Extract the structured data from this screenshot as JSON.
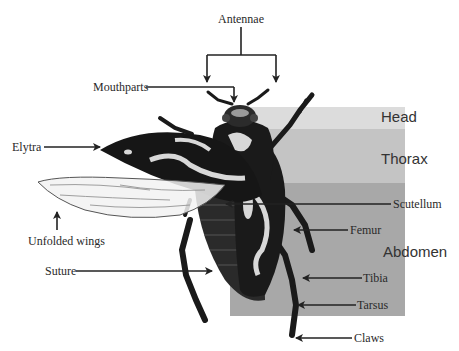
{
  "diagram": {
    "colors": {
      "head_band": "#dcdcdc",
      "thorax_band": "#c4c4c4",
      "abdomen_band": "#a8a8a8",
      "beetle_body": "#1a1a1a",
      "beetle_highlight": "#d8d8d8",
      "wing_fill": "#f2f2f2",
      "arrow": "#222222"
    },
    "regions": [
      {
        "id": "head",
        "label": "Head"
      },
      {
        "id": "thorax",
        "label": "Thorax"
      },
      {
        "id": "abdomen",
        "label": "Abdomen"
      }
    ],
    "parts": {
      "antennae": "Antennae",
      "mouthparts": "Mouthparts",
      "elytra": "Elytra",
      "unfolded_wings": "Unfolded wings",
      "suture": "Suture",
      "scutellum": "Scutellum",
      "femur": "Femur",
      "tibia": "Tibia",
      "tarsus": "Tarsus",
      "claws": "Claws"
    }
  }
}
